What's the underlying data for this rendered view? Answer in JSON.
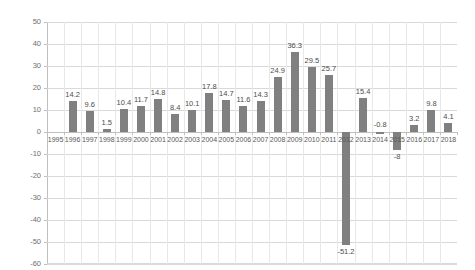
{
  "chart_data": {
    "type": "bar",
    "title": "",
    "subtitle": "",
    "xlabel": "",
    "ylabel": "",
    "ylim": [
      -60,
      50
    ],
    "ytick_step": 10,
    "grid": true,
    "legend": "none",
    "bar_color": "#808080",
    "gridline_color": "#d9d9d9",
    "categories": [
      "1995",
      "1996",
      "1997",
      "1998",
      "1999",
      "2000",
      "2001",
      "2002",
      "2003",
      "2004",
      "2005",
      "2006",
      "2007",
      "2008",
      "2009",
      "2010",
      "2011",
      "2012",
      "2013",
      "2014",
      "2015",
      "2016",
      "2017",
      "2018"
    ],
    "values": [
      null,
      14.2,
      9.6,
      1.5,
      10.4,
      11.7,
      14.8,
      8.4,
      10.1,
      17.8,
      14.7,
      11.6,
      14.3,
      24.9,
      36.3,
      29.5,
      25.7,
      -51.2,
      15.4,
      -0.8,
      -8,
      3.2,
      9.8,
      4.1
    ],
    "data_labels": [
      "",
      "14.2",
      "9.6",
      "1.5",
      "10.4",
      "11.7",
      "14.8",
      "8.4",
      "10.1",
      "17.8",
      "14.7",
      "11.6",
      "14.3",
      "24.9",
      "36.3",
      "29.5",
      "25.7",
      "-51.2",
      "15.4",
      "-0.8",
      "-8",
      "3.2",
      "9.8",
      "4.1"
    ],
    "ytick_labels": [
      "50",
      "40",
      "30",
      "20",
      "10",
      "0",
      "-10",
      "-20",
      "-30",
      "-40",
      "-50",
      "-60"
    ],
    "ytick_values": [
      50,
      40,
      30,
      20,
      10,
      0,
      -10,
      -20,
      -30,
      -40,
      -50,
      -60
    ]
  }
}
